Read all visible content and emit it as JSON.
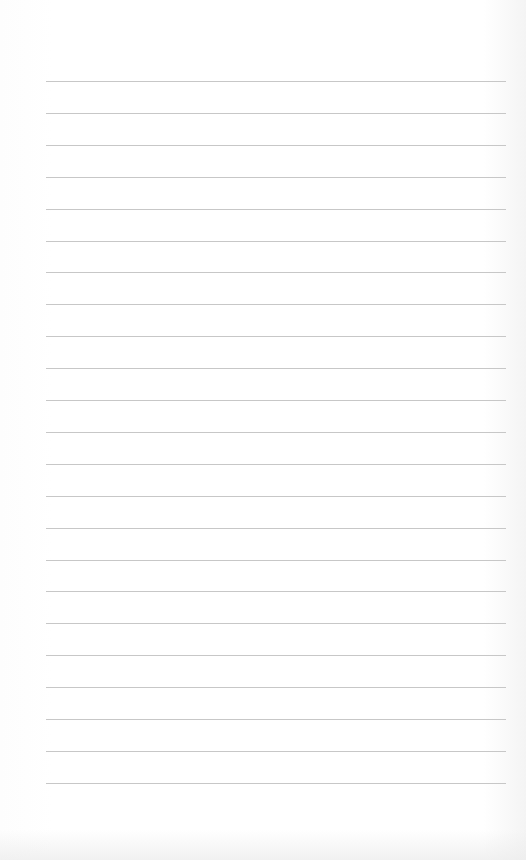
{
  "paper": {
    "type": "lined-paper",
    "line_count": 23,
    "first_line_y": 81,
    "line_spacing": 31.9,
    "line_left": 46,
    "line_width": 460,
    "line_color": "#bdbdbd",
    "background_color": "#ffffff"
  }
}
